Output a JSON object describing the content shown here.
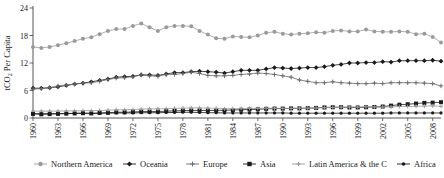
{
  "chart_data": {
    "type": "line",
    "title": "",
    "xlabel": "",
    "ylabel": "tCO2 Per Capita",
    "ylabel_rich": {
      "pre": "tCO",
      "sub": "2",
      "post": " Per Capita"
    },
    "xlim": [
      1960,
      2009
    ],
    "ylim": [
      0,
      24
    ],
    "yticks": [
      0,
      6,
      12,
      18,
      24
    ],
    "ytick_labels": [
      "0",
      "6",
      "12",
      "18",
      "24"
    ],
    "xticks": [
      1960,
      1963,
      1966,
      1969,
      1972,
      1975,
      1978,
      1981,
      1984,
      1987,
      1990,
      1993,
      1996,
      1999,
      2002,
      2005,
      2008
    ],
    "xtick_labels": [
      "1960",
      "1963",
      "1966",
      "1969",
      "1972",
      "1975",
      "1978",
      "1981",
      "1984",
      "1987",
      "1990",
      "1993",
      "1996",
      "1999",
      "2002",
      "2005",
      "2008"
    ],
    "x": [
      1960,
      1961,
      1962,
      1963,
      1964,
      1965,
      1966,
      1967,
      1968,
      1969,
      1970,
      1971,
      1972,
      1973,
      1974,
      1975,
      1976,
      1977,
      1978,
      1979,
      1980,
      1981,
      1982,
      1983,
      1984,
      1985,
      1986,
      1987,
      1988,
      1989,
      1990,
      1991,
      1992,
      1993,
      1994,
      1995,
      1996,
      1997,
      1998,
      1999,
      2000,
      2001,
      2002,
      2003,
      2004,
      2005,
      2006,
      2007,
      2008,
      2009
    ],
    "grid": false,
    "legend_position": "bottom",
    "series": [
      {
        "name": "Northern America",
        "color": "#9a9a9a",
        "marker": "circle",
        "marker_size": 2.0,
        "values": [
          15.5,
          15.3,
          15.5,
          15.9,
          16.3,
          16.8,
          17.3,
          17.6,
          18.3,
          19.0,
          19.4,
          19.4,
          20.1,
          20.6,
          19.8,
          19.0,
          19.8,
          20.1,
          20.1,
          20.0,
          19.0,
          18.2,
          17.4,
          17.3,
          17.8,
          17.7,
          17.6,
          18.0,
          18.6,
          18.8,
          18.4,
          18.2,
          18.4,
          18.5,
          18.7,
          18.6,
          19.0,
          19.1,
          18.9,
          18.9,
          19.3,
          18.9,
          18.8,
          18.8,
          18.9,
          18.8,
          18.3,
          18.4,
          17.7,
          16.5
        ]
      },
      {
        "name": "Oceania",
        "color": "#1a1a1a",
        "marker": "diamond",
        "marker_size": 2.4,
        "values": [
          6.5,
          6.5,
          6.6,
          6.8,
          7.1,
          7.4,
          7.6,
          7.9,
          8.2,
          8.5,
          8.9,
          9.0,
          9.1,
          9.4,
          9.4,
          9.3,
          9.6,
          9.9,
          9.9,
          10.1,
          10.2,
          10.1,
          10.0,
          9.8,
          10.1,
          10.4,
          10.4,
          10.4,
          10.7,
          11.0,
          10.9,
          10.8,
          10.9,
          11.0,
          11.0,
          11.2,
          11.5,
          11.7,
          12.0,
          12.0,
          12.1,
          12.1,
          12.3,
          12.2,
          12.5,
          12.5,
          12.5,
          12.5,
          12.6,
          12.4
        ]
      },
      {
        "name": "Europe",
        "color": "#6b6b6b",
        "marker": "plus",
        "marker_size": 2.2,
        "values": [
          6.3,
          6.4,
          6.6,
          7.0,
          7.2,
          7.4,
          7.6,
          7.7,
          8.0,
          8.4,
          8.7,
          8.8,
          9.0,
          9.4,
          9.2,
          9.1,
          9.5,
          9.5,
          9.7,
          10.0,
          9.7,
          9.3,
          9.2,
          9.2,
          9.3,
          9.5,
          9.6,
          9.8,
          9.7,
          9.5,
          9.2,
          8.9,
          8.3,
          8.0,
          7.7,
          7.7,
          7.9,
          7.7,
          7.6,
          7.5,
          7.5,
          7.6,
          7.5,
          7.7,
          7.7,
          7.7,
          7.7,
          7.6,
          7.5,
          7.0
        ]
      },
      {
        "name": "Asia",
        "color": "#1a1a1a",
        "marker": "square",
        "marker_size": 2.0,
        "values": [
          0.9,
          0.8,
          0.85,
          0.9,
          0.95,
          1.0,
          1.05,
          1.0,
          1.1,
          1.15,
          1.25,
          1.25,
          1.3,
          1.4,
          1.4,
          1.4,
          1.5,
          1.55,
          1.6,
          1.65,
          1.65,
          1.65,
          1.65,
          1.7,
          1.75,
          1.8,
          1.85,
          1.9,
          2.0,
          2.05,
          2.05,
          2.1,
          2.1,
          2.15,
          2.2,
          2.3,
          2.35,
          2.35,
          2.3,
          2.3,
          2.35,
          2.4,
          2.5,
          2.7,
          2.9,
          3.0,
          3.15,
          3.3,
          3.35,
          3.45
        ]
      },
      {
        "name": "Latin America & the C",
        "color": "#9a9a9a",
        "marker": "plus",
        "marker_size": 2.0,
        "values": [
          1.5,
          1.5,
          1.5,
          1.5,
          1.55,
          1.55,
          1.6,
          1.6,
          1.65,
          1.7,
          1.8,
          1.8,
          1.85,
          1.95,
          2.0,
          2.0,
          2.05,
          2.1,
          2.15,
          2.2,
          2.2,
          2.15,
          2.1,
          2.0,
          2.05,
          2.05,
          2.1,
          2.1,
          2.15,
          2.15,
          2.1,
          2.1,
          2.15,
          2.15,
          2.2,
          2.25,
          2.3,
          2.35,
          2.4,
          2.4,
          2.45,
          2.4,
          2.4,
          2.4,
          2.5,
          2.5,
          2.55,
          2.6,
          2.65,
          2.55
        ]
      },
      {
        "name": "Africa",
        "color": "#1a1a1a",
        "marker": "dot",
        "marker_size": 1.6,
        "values": [
          0.95,
          0.95,
          0.95,
          0.95,
          1.0,
          1.0,
          1.05,
          1.0,
          1.05,
          1.05,
          1.1,
          1.1,
          1.1,
          1.15,
          1.15,
          1.15,
          1.2,
          1.2,
          1.25,
          1.25,
          1.2,
          1.15,
          1.15,
          1.1,
          1.1,
          1.1,
          1.1,
          1.1,
          1.1,
          1.1,
          1.1,
          1.05,
          1.05,
          1.05,
          1.05,
          1.05,
          1.05,
          1.05,
          1.05,
          1.05,
          1.05,
          1.05,
          1.05,
          1.1,
          1.1,
          1.1,
          1.1,
          1.1,
          1.1,
          1.1
        ]
      }
    ]
  },
  "legend": {
    "items": [
      {
        "label": "Northern America"
      },
      {
        "label": "Oceania"
      },
      {
        "label": "Europe"
      },
      {
        "label": "Asia"
      },
      {
        "label": "Latin America & the C"
      },
      {
        "label": "Africa"
      }
    ]
  }
}
